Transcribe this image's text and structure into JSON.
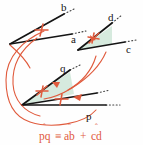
{
  "figure": {
    "colors": {
      "stroke_black": "#141414",
      "accent_red": "#e05a3c",
      "shade_green": "#cfe6d8",
      "background": "#fefefe"
    },
    "ray_labels": {
      "b": "b",
      "a": "a",
      "d": "d",
      "c": "c",
      "q": "q",
      "p": "p"
    },
    "formula": {
      "term1": "pq",
      "relation": "≡",
      "term2": "ab",
      "operator": "+",
      "term3": "cd",
      "hat": "ˆ",
      "full": "p̂q ≡ âb + ĉd"
    },
    "annotations": {
      "tick_mark": "single-tick",
      "arc_arrow": "arrow-head",
      "shaded_angle": "angle-region-fill"
    }
  }
}
